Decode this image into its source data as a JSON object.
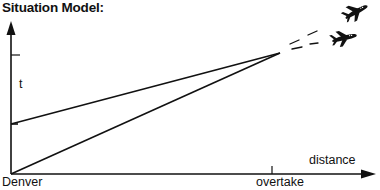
{
  "title": "Situation Model:",
  "axes": {
    "y_label": "t",
    "x_label": "distance",
    "origin_label": "Denver",
    "x_tick_label": "overtake"
  },
  "lines": [
    {
      "name": "slower-earlier-plane",
      "from": [
        11,
        124
      ],
      "to": [
        280,
        53
      ]
    },
    {
      "name": "faster-later-plane",
      "from": [
        11,
        174
      ],
      "to": [
        280,
        53
      ]
    }
  ],
  "icons": [
    "airplane-icon",
    "airplane-icon"
  ],
  "colors": {
    "ink": "#111111",
    "background": "#ffffff"
  }
}
